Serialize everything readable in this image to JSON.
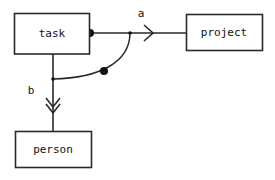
{
  "diagram": {
    "type": "entity-relationship-diagram",
    "background_color": "#ffffff",
    "stroke_color": "#2a2a2a",
    "text_color": "#111111",
    "entities": [
      {
        "id": "task",
        "label": "task"
      },
      {
        "id": "project",
        "label": "project"
      },
      {
        "id": "person",
        "label": "person"
      }
    ],
    "edges": [
      {
        "id": "a",
        "label": "a",
        "from": "task",
        "to": "project",
        "source_marker": "filled-dot",
        "target_marker": "open-chevron-arrow"
      },
      {
        "id": "b",
        "label": "b",
        "from": "task",
        "to": "person",
        "source_marker": "none",
        "target_marker": "double-chevron-arrow"
      },
      {
        "id": "curve",
        "label": "",
        "from": "a",
        "to": "b",
        "source_marker": "none",
        "target_marker": "none",
        "midpoint_marker": "filled-dot"
      }
    ]
  }
}
